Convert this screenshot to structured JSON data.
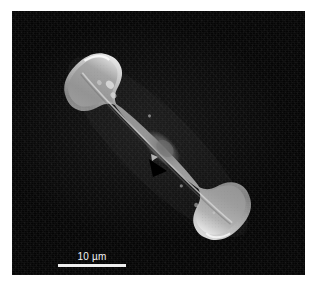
{
  "figure": {
    "kind": "sem-micrograph",
    "caption_visible": false,
    "panel": {
      "background_color": "#050505",
      "page_color": "#ffffff",
      "left": 12,
      "top": 11,
      "width": 293,
      "height": 264
    }
  },
  "specimen": {
    "name": "diatom-frustule",
    "view": "valve-view",
    "outline_description": "elongate lanceolate valve with capitate rounded apices, oriented diagonally from upper-left to lower-right",
    "orientation_degrees": 44,
    "surface_color": "#9a9a9a",
    "rim_highlight_color": "#f2f2f2",
    "features": [
      {
        "name": "axial-sternum-line",
        "label": ""
      },
      {
        "name": "central-area-nodule",
        "label": ""
      },
      {
        "name": "upper-apex",
        "label": ""
      },
      {
        "name": "lower-apex",
        "label": ""
      }
    ]
  },
  "annotations": {
    "arrowhead": {
      "name": "arrowhead-marker",
      "color": "#000000",
      "points_to": "central-area-nodule",
      "direction": "down-left",
      "x": 149,
      "y": 160
    }
  },
  "scale_bar": {
    "label": "10 µm",
    "value": 10,
    "unit": "µm",
    "bar_color": "#efefef",
    "text_color": "#f2f2f2",
    "bar_length_px": 68,
    "position": {
      "left": 52,
      "top": 251
    }
  }
}
